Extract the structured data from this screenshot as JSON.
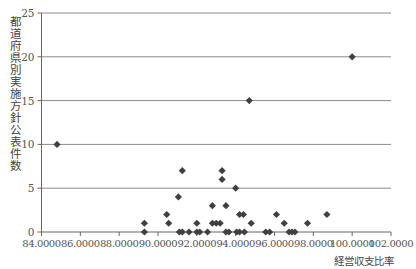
{
  "chart_data": {
    "type": "scatter",
    "title": "",
    "xlabel": "経営収支比率",
    "ylabel": "都道府県別実施方針公表件数",
    "xlim": [
      84,
      102
    ],
    "ylim": [
      0,
      25
    ],
    "x_ticks": [
      "84.0000",
      "86.0000",
      "88.0000",
      "90.0000",
      "92.0000",
      "94.0000",
      "96.0000",
      "98.0000",
      "100.0000",
      "102.0000"
    ],
    "y_ticks": [
      "0",
      "5",
      "10",
      "15",
      "20",
      "25"
    ],
    "grid": "horizontal",
    "legend": "none",
    "marker": "diamond",
    "marker_color": "#404040",
    "points": [
      [
        84.8,
        10
      ],
      [
        100.0,
        20
      ],
      [
        94.7,
        15
      ],
      [
        89.3,
        1
      ],
      [
        89.3,
        0
      ],
      [
        90.45,
        2
      ],
      [
        90.55,
        1
      ],
      [
        91.05,
        4
      ],
      [
        91.25,
        7
      ],
      [
        91.1,
        0
      ],
      [
        91.25,
        0
      ],
      [
        91.6,
        0
      ],
      [
        92.0,
        1
      ],
      [
        92.0,
        0
      ],
      [
        92.15,
        0
      ],
      [
        92.55,
        0
      ],
      [
        92.8,
        3
      ],
      [
        92.8,
        1
      ],
      [
        93.0,
        1
      ],
      [
        93.2,
        1
      ],
      [
        93.3,
        7
      ],
      [
        93.3,
        6
      ],
      [
        93.5,
        3
      ],
      [
        93.5,
        0
      ],
      [
        93.65,
        0
      ],
      [
        94.05,
        0
      ],
      [
        94.2,
        0
      ],
      [
        94.45,
        0
      ],
      [
        94.0,
        5
      ],
      [
        94.2,
        2
      ],
      [
        94.4,
        2
      ],
      [
        94.8,
        1
      ],
      [
        95.55,
        0
      ],
      [
        95.75,
        0
      ],
      [
        96.1,
        2
      ],
      [
        96.5,
        1
      ],
      [
        96.75,
        0
      ],
      [
        96.9,
        0
      ],
      [
        97.05,
        0
      ],
      [
        97.7,
        1
      ],
      [
        98.7,
        2
      ]
    ]
  },
  "axis": {
    "ylabel": "都道府県別実施方針公表件数",
    "xlabel": "経営収支比率"
  }
}
